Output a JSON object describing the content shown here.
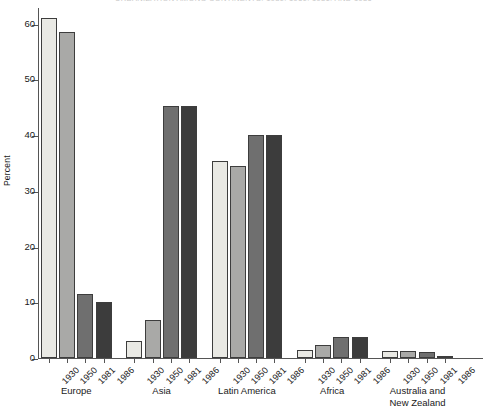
{
  "chart_data": {
    "type": "bar",
    "title": "URBANIZATION AMONG CONTINENTS: 1930, 1950, 1981, AND 1986",
    "xlabel": "",
    "ylabel": "Percent",
    "ylim": [
      0,
      63
    ],
    "yticks": [
      0,
      10,
      20,
      30,
      40,
      50,
      60
    ],
    "ytick_labels": [
      "0",
      "10",
      "20",
      "30",
      "40",
      "50",
      "60"
    ],
    "grid": false,
    "legend": "none",
    "categories": [
      "1930",
      "1950",
      "1981",
      "1986"
    ],
    "groups": [
      {
        "name": "Europe",
        "label_lines": "Europe",
        "years": [
          "1930",
          "1950",
          "1981",
          "1986"
        ],
        "values": [
          61.0,
          58.5,
          11.5,
          10.0
        ]
      },
      {
        "name": "Asia",
        "label_lines": "Asia",
        "years": [
          "1930",
          "1950",
          "1981",
          "1986"
        ],
        "values": [
          3.0,
          6.8,
          45.3,
          45.3
        ]
      },
      {
        "name": "Latin America",
        "label_lines": "Latin America",
        "years": [
          "1930",
          "1950",
          "1981",
          "1986"
        ],
        "values": [
          35.3,
          34.4,
          40.0,
          40.0
        ]
      },
      {
        "name": "Africa",
        "label_lines": "Africa",
        "years": [
          "1930",
          "1950",
          "1981",
          "1986"
        ],
        "values": [
          1.5,
          2.4,
          3.7,
          3.7
        ]
      },
      {
        "name": "Australia and New Zealand",
        "label_lines": "Australia  and\nNew Zealand",
        "years": [
          "1930",
          "1950",
          "1981",
          "1986"
        ],
        "values": [
          1.3,
          1.2,
          1.0,
          0.4
        ]
      }
    ],
    "series_colors": {
      "1930": "#e9e9e4",
      "1950": "#a9a9a7",
      "1981": "#6f6f6f",
      "1986": "#3c3c3c"
    },
    "bar_edge_color": "#3d3d3d",
    "axis_color": "#555555",
    "background_color": "#ffffff",
    "text_color": "#1a1a1a"
  }
}
